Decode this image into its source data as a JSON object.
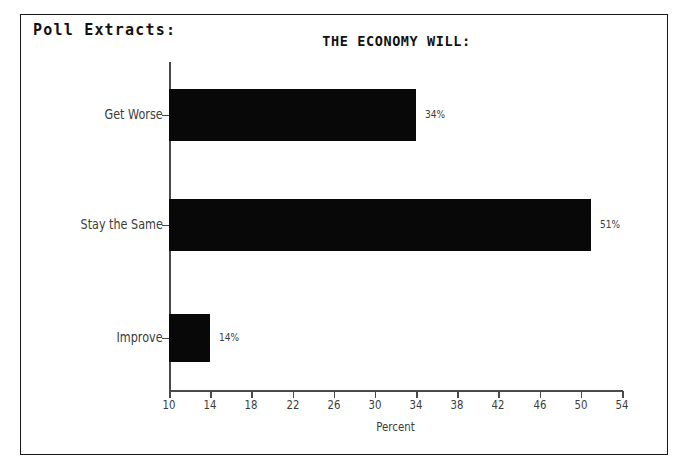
{
  "frame": {
    "caption": "Poll Extracts:"
  },
  "chart_data": {
    "type": "bar",
    "orientation": "horizontal",
    "title": "THE ECONOMY WILL:",
    "xlabel": "Percent",
    "ylabel": "",
    "categories": [
      "Get Worse",
      "Stay the Same",
      "Improve"
    ],
    "values": [
      34,
      51,
      14
    ],
    "data_labels": [
      "34%",
      "51%",
      "14%"
    ],
    "xlim": [
      10,
      54
    ],
    "xticks": [
      10,
      14,
      18,
      22,
      26,
      30,
      34,
      38,
      42,
      46,
      50,
      54
    ],
    "xtick_labels": [
      "10",
      "14",
      "18",
      "22",
      "26",
      "30",
      "34",
      "38",
      "42",
      "46",
      "50",
      "54"
    ],
    "grid": false,
    "legend": false,
    "bar_color": "#080808",
    "axis_color": "#4a4a4a",
    "text_color": "#3c3c3c"
  }
}
